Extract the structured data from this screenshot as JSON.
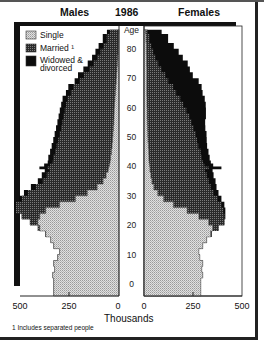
{
  "header": {
    "left": "Males",
    "center": "1986",
    "right": "Females"
  },
  "footnote": "1 Includes separated people",
  "colors": {
    "single": "#c8c8c8",
    "married": "#4a4a4a",
    "widowed": "#0c0c0c",
    "frame": "#222222"
  },
  "chart_data": {
    "type": "bar",
    "subtype": "population-pyramid-stacked",
    "title": "1986",
    "xlabel": "Thousands",
    "ylabel": "Age",
    "left_title": "Males",
    "right_title": "Females",
    "x_ticks": [
      "500",
      "250",
      "0",
      "0",
      "250",
      "500"
    ],
    "x_range": [
      0,
      500
    ],
    "y_range": [
      0,
      85
    ],
    "age_ticks": [
      "0",
      "10",
      "20",
      "30",
      "40",
      "50",
      "60",
      "70",
      "80"
    ],
    "legend": [
      {
        "name": "Single",
        "key": "single"
      },
      {
        "name": "Married ¹",
        "key": "married"
      },
      {
        "name": "Widowed & divorced",
        "key": "widowed"
      }
    ],
    "legend_position": "top-left",
    "ages": [
      0,
      2,
      4,
      6,
      8,
      10,
      12,
      14,
      16,
      18,
      20,
      22,
      24,
      26,
      28,
      30,
      32,
      34,
      36,
      38,
      39,
      40,
      41,
      42,
      44,
      46,
      48,
      50,
      52,
      54,
      56,
      58,
      60,
      62,
      64,
      66,
      68,
      70,
      72,
      74,
      76,
      78,
      80,
      82,
      85
    ],
    "males": {
      "single": [
        330,
        335,
        325,
        330,
        310,
        300,
        330,
        345,
        370,
        400,
        410,
        400,
        370,
        300,
        220,
        160,
        110,
        80,
        65,
        55,
        52,
        48,
        45,
        42,
        38,
        35,
        32,
        30,
        28,
        26,
        25,
        24,
        22,
        20,
        18,
        16,
        14,
        12,
        10,
        8,
        6,
        4,
        3,
        2,
        1
      ],
      "married": [
        0,
        0,
        0,
        0,
        0,
        0,
        0,
        0,
        2,
        10,
        40,
        90,
        150,
        220,
        270,
        300,
        310,
        305,
        300,
        295,
        310,
        300,
        290,
        290,
        285,
        280,
        275,
        270,
        265,
        260,
        255,
        250,
        245,
        240,
        225,
        215,
        185,
        165,
        140,
        120,
        105,
        90,
        75,
        60,
        45
      ],
      "widowed": [
        0,
        0,
        0,
        0,
        0,
        0,
        0,
        0,
        0,
        0,
        0,
        2,
        5,
        10,
        15,
        20,
        25,
        25,
        25,
        25,
        40,
        30,
        25,
        25,
        25,
        25,
        25,
        25,
        25,
        25,
        25,
        25,
        25,
        25,
        25,
        25,
        25,
        30,
        30,
        30,
        25,
        25,
        25,
        20,
        15
      ]
    },
    "females": {
      "single": [
        290,
        300,
        295,
        300,
        285,
        280,
        300,
        320,
        340,
        350,
        330,
        280,
        220,
        150,
        100,
        70,
        50,
        40,
        35,
        30,
        30,
        28,
        26,
        25,
        24,
        22,
        20,
        19,
        18,
        17,
        16,
        16,
        15,
        15,
        14,
        14,
        14,
        14,
        14,
        13,
        13,
        12,
        12,
        10,
        8
      ],
      "married": [
        0,
        0,
        0,
        0,
        0,
        0,
        0,
        0,
        5,
        30,
        80,
        130,
        185,
        245,
        275,
        285,
        290,
        290,
        285,
        280,
        300,
        280,
        275,
        270,
        265,
        255,
        250,
        245,
        235,
        225,
        215,
        200,
        185,
        170,
        150,
        135,
        110,
        95,
        75,
        60,
        45,
        35,
        25,
        18,
        12
      ],
      "widowed": [
        0,
        0,
        0,
        0,
        0,
        0,
        0,
        0,
        0,
        0,
        0,
        5,
        10,
        15,
        20,
        25,
        30,
        35,
        35,
        40,
        65,
        45,
        40,
        40,
        40,
        45,
        50,
        55,
        60,
        70,
        85,
        100,
        115,
        125,
        135,
        145,
        155,
        140,
        145,
        150,
        140,
        130,
        115,
        95,
        70
      ]
    },
    "grid": false
  }
}
